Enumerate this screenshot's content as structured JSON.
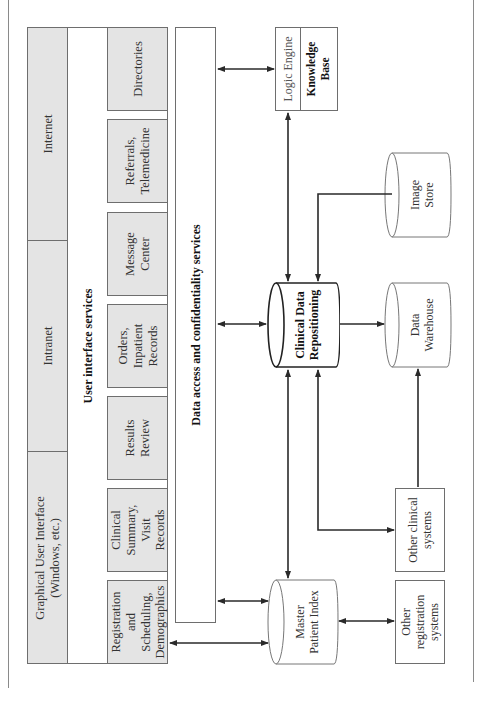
{
  "diagram": {
    "orientation": "rotated 90deg counter-clockwise",
    "networks": [
      {
        "id": "internet",
        "label": "Internet"
      },
      {
        "id": "intranet",
        "label": "Intranet"
      },
      {
        "id": "gui",
        "label": "Graphical User Interface\n(Windows, etc.)"
      }
    ],
    "ui_services_label": "User interface services",
    "services": [
      {
        "id": "directories",
        "label": "Directories"
      },
      {
        "id": "referrals",
        "label": "Referrals,\nTelemedicine"
      },
      {
        "id": "message-center",
        "label": "Message\nCenter"
      },
      {
        "id": "orders",
        "label": "Orders,\nInpatient\nRecords"
      },
      {
        "id": "results-review",
        "label": "Results\nReview"
      },
      {
        "id": "clinical-summary",
        "label": "Clinical\nSummary,\nVisit\nRecords"
      },
      {
        "id": "registration",
        "label": "Registration\nand\nScheduling,\nDemographics"
      }
    ],
    "data_access_label": "Data access and confidentiality services",
    "logic_engine": {
      "label": "Logic Engine",
      "knowledge_base": "Knowledge\nBase"
    },
    "repositories": {
      "cdr": "Clinical Data\nRepositioning",
      "image_store": "Image\nStore",
      "data_warehouse": "Data\nWarehouse",
      "mpi": "Master\nPatient Index"
    },
    "external": {
      "other_clinical": "Other clinical\nsystems",
      "other_registration": "Other\nregistration\nsystems"
    },
    "connections": [
      {
        "from": "data-access",
        "to": "logic-engine",
        "type": "bidirectional"
      },
      {
        "from": "logic-engine",
        "to": "cdr",
        "type": "bidirectional"
      },
      {
        "from": "image-store",
        "to": "cdr",
        "type": "directed"
      },
      {
        "from": "data-access",
        "to": "cdr",
        "type": "bidirectional"
      },
      {
        "from": "cdr",
        "to": "data-warehouse",
        "type": "directed"
      },
      {
        "from": "cdr",
        "to": "mpi",
        "type": "bidirectional"
      },
      {
        "from": "cdr",
        "to": "other-clinical",
        "type": "bidirectional"
      },
      {
        "from": "other-clinical",
        "to": "data-warehouse",
        "type": "directed"
      },
      {
        "from": "data-access",
        "to": "mpi",
        "type": "bidirectional"
      },
      {
        "from": "registration",
        "to": "mpi",
        "type": "bidirectional"
      },
      {
        "from": "mpi",
        "to": "other-registration",
        "type": "bidirectional"
      }
    ],
    "colors": {
      "box_fill": "#e4e4e4",
      "border": "#6e6e6e",
      "arrow": "#2a2a2a"
    }
  }
}
